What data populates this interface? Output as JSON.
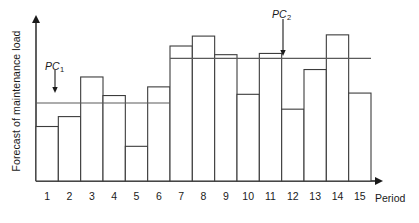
{
  "chart_data": {
    "type": "bar",
    "title": "",
    "subtitle": "",
    "xlabel": "Period",
    "ylabel": "Forecast of maintenance load",
    "categories": [
      "1",
      "2",
      "3",
      "4",
      "5",
      "6",
      "7",
      "8",
      "9",
      "10",
      "11",
      "12",
      "13",
      "14",
      "15"
    ],
    "values": [
      44,
      52,
      84,
      69,
      28,
      76,
      109,
      117,
      102,
      70,
      103,
      58,
      90,
      118,
      71
    ],
    "xlim": [
      0.5,
      15.5
    ],
    "ylim": [
      0,
      130
    ],
    "grid": false,
    "legend": null,
    "series": [
      {
        "name": "Forecast of maintenance load",
        "values": [
          44,
          52,
          84,
          69,
          28,
          76,
          109,
          117,
          102,
          70,
          103,
          58,
          90,
          118,
          71
        ]
      }
    ],
    "annotations": [
      {
        "name": "PC1",
        "label": "PC",
        "subscript": "1",
        "kind": "horizontal-level-line-with-arrow",
        "level_value": 63,
        "spans_periods": [
          "1",
          "6"
        ]
      },
      {
        "name": "PC2",
        "label": "PC",
        "subscript": "2",
        "kind": "horizontal-level-line-with-arrow",
        "level_value": 99,
        "spans_periods": [
          "7",
          "15"
        ]
      }
    ],
    "colors": {
      "axis": "#1a1a1a",
      "bar_outline": "#3c3c3c",
      "bar_fill": "#ffffff",
      "level_line": "#5a5a5a",
      "text": "#1a1a1a"
    }
  },
  "axes": {
    "y_title": "Forecast of maintenance load",
    "x_title": "Period"
  },
  "ticks": {
    "x": [
      "1",
      "2",
      "3",
      "4",
      "5",
      "6",
      "7",
      "8",
      "9",
      "10",
      "11",
      "12",
      "13",
      "14",
      "15"
    ]
  },
  "annotations": {
    "pc1": {
      "text": "PC",
      "sub": "1"
    },
    "pc2": {
      "text": "PC",
      "sub": "2"
    }
  }
}
